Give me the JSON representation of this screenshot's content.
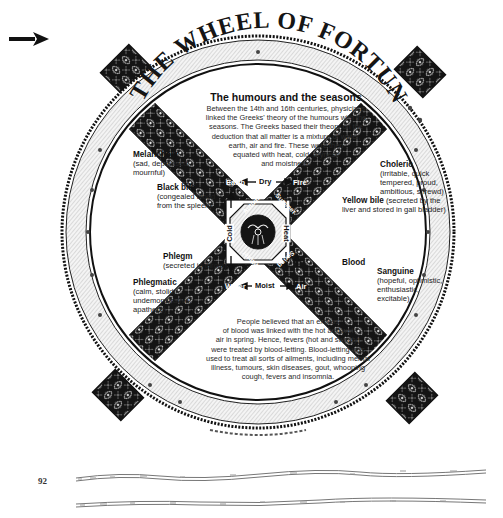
{
  "page": {
    "page_number": "92",
    "pointer": "arrow-right-icon"
  },
  "wheel": {
    "title_banner": "THE WHEEL OF FORTUNE",
    "center_emblem": "wheel-hub-emblem"
  },
  "intro": {
    "title": "The humours and the seasons",
    "lines": [
      "Between the 14th and 16th centuries, physicians",
      "linked the Greeks' theory of the humours with the",
      "seasons. The Greeks based their theory on the",
      "deduction that all matter is a mixture of water,",
      "earth, air and fire. These were then",
      "equated with heat, cold, dryness",
      "and moistness."
    ]
  },
  "temperaments": {
    "melancholy": {
      "name": "Melancholy",
      "desc": [
        "(sad, depressed,",
        "mournful)"
      ]
    },
    "choleric": {
      "name": "Choleric",
      "desc": [
        "(irritable, quick",
        "tempered, proud,",
        "ambitious, shrewd)"
      ]
    },
    "phlegmatic": {
      "name": "Phlegmatic",
      "desc": [
        "(calm, stolid,",
        "undemonstrative,",
        "apathetic)"
      ]
    },
    "sanguine": {
      "name": "Sanguine",
      "desc": [
        "(hopeful, optimistic,",
        "enthusiastic,",
        "excitable)"
      ]
    }
  },
  "humours": {
    "black_bile": {
      "name": "Black bile",
      "desc": [
        "(congealed blood",
        "from the spleen)"
      ]
    },
    "yellow_bile": {
      "name": "Yellow bile",
      "desc_inline": "(secreted by the",
      "desc2": "liver and stored in gall bladder)"
    },
    "phlegm": {
      "name": "Phlegm",
      "desc": "(secreted in throat)"
    },
    "blood": {
      "name": "Blood"
    }
  },
  "elements": {
    "earth": "Earth",
    "fire": "Fire",
    "water": "Water",
    "air": "Air"
  },
  "seasons": {
    "autumn": "Autumn",
    "summer": "Summer",
    "winter": "Winter",
    "spring": "Spring"
  },
  "qualities": {
    "dry": "Dry",
    "cold": "Cold",
    "heat": "Heat",
    "moist": "Moist"
  },
  "bloodletting": {
    "lines": [
      "People believed that an excess",
      "of blood was linked with the hot and wet",
      "air in spring. Hence, fevers (hot and sweaty)",
      "were treated by blood-letting. Blood-letting was",
      "used to treat all sorts of ailments, including mental",
      "illness, tumours, skin diseases, gout, whooping",
      "cough, fevers and insomnia."
    ]
  },
  "colors": {
    "ink": "#111111",
    "paper": "#ffffff",
    "rim_fill": "#f2f2f2",
    "spoke_fill": "#141414"
  }
}
